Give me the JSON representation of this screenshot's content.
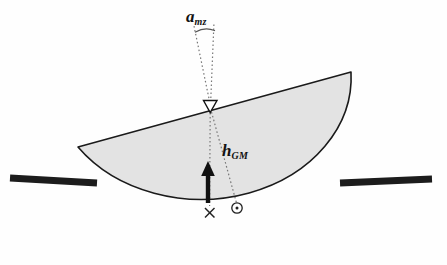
{
  "figure": {
    "width": 447,
    "height": 265,
    "background_color": "#fefefe"
  },
  "labels": {
    "angle_label": {
      "base": "a",
      "subscript": "mz",
      "full": "a_mz",
      "x": 186,
      "y": 8
    },
    "height_label": {
      "base": "h",
      "subscript": "GM",
      "full": "h_GM",
      "x": 222,
      "y": 142
    }
  },
  "markers": {
    "metacenter": {
      "icon": "down-triangle-marker",
      "x": 210,
      "y": 107
    },
    "center_of_gravity": {
      "icon": "cross-marker",
      "x": 210,
      "y": 213
    },
    "center_of_buoyancy": {
      "icon": "circle-dot-marker",
      "x": 237,
      "y": 208
    }
  },
  "shapes": {
    "hull": {
      "name": "heeled-hull-dome",
      "fill_color": "#e3e3e3",
      "stroke_color": "#1a1a1a"
    },
    "waterline": {
      "name": "waterline",
      "color": "#1c1c1c",
      "left_x1": 10,
      "left_x2": 97,
      "right_x1": 340,
      "right_x2": 432,
      "y": 181
    },
    "buoyancy_arrow": {
      "name": "buoyancy-force-arrow",
      "color": "#111111",
      "x": 208,
      "tail_y": 203,
      "head_y": 163
    },
    "angle_arc": {
      "name": "heel-angle-arc",
      "color": "#555555"
    },
    "dotted_lines": {
      "color": "#777777",
      "dash": "1.6 2.4"
    }
  }
}
